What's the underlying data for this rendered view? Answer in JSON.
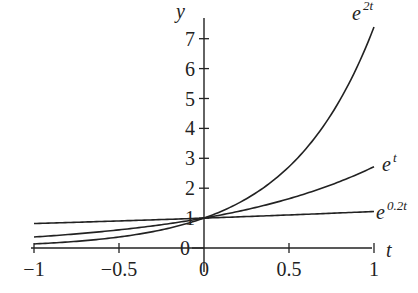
{
  "chart_data": {
    "type": "line",
    "title": "",
    "xlabel": "t",
    "ylabel": "y",
    "xlim": [
      -1,
      1
    ],
    "ylim": [
      0,
      7.5
    ],
    "grid": false,
    "legend": "inline labels at right end of curves",
    "x_ticks": [
      -1,
      -0.5,
      0,
      0.5,
      1
    ],
    "x_tick_labels": [
      "−1",
      "−0.5",
      "0",
      "0.5",
      "1"
    ],
    "y_ticks": [
      0,
      1,
      2,
      3,
      4,
      5,
      6,
      7
    ],
    "y_tick_labels": [
      "0",
      "1",
      "2",
      "3",
      "4",
      "5",
      "6",
      "7"
    ],
    "x": [
      -1,
      -0.75,
      -0.5,
      -0.25,
      0,
      0.25,
      0.5,
      0.75,
      1
    ],
    "series": [
      {
        "name": "e^{2t}",
        "label_base": "e",
        "label_exp": "2t",
        "k": 2,
        "values": [
          0.135,
          0.223,
          0.368,
          0.607,
          1.0,
          1.649,
          2.718,
          4.482,
          7.389
        ]
      },
      {
        "name": "e^{t}",
        "label_base": "e",
        "label_exp": "t",
        "k": 1,
        "values": [
          0.368,
          0.472,
          0.607,
          0.779,
          1.0,
          1.284,
          1.649,
          2.117,
          2.718
        ]
      },
      {
        "name": "e^{0.2t}",
        "label_base": "e",
        "label_exp": "0.2t",
        "k": 0.2,
        "values": [
          0.819,
          0.861,
          0.905,
          0.951,
          1.0,
          1.051,
          1.105,
          1.162,
          1.221
        ]
      }
    ]
  },
  "colors": {
    "line": "#222222",
    "background": "#ffffff"
  }
}
